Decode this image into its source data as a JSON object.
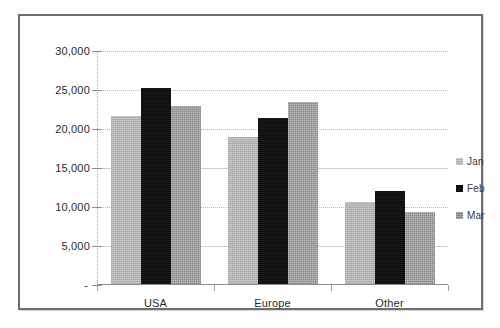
{
  "chart_data": {
    "type": "bar",
    "title": "",
    "xlabel": "",
    "ylabel": "",
    "categories": [
      "USA",
      "Europe",
      "Other"
    ],
    "series": [
      {
        "name": "Jan",
        "color": "#b2b2b2",
        "values": [
          21700,
          19000,
          10700
        ]
      },
      {
        "name": "Feb",
        "color": "#100f0f",
        "values": [
          25300,
          21400,
          12000
        ]
      },
      {
        "name": "Mar",
        "color": "#888888",
        "values": [
          22900,
          23500,
          9400
        ]
      }
    ],
    "ylim": [
      0,
      30000
    ],
    "ytick_values": [
      0,
      5000,
      10000,
      15000,
      20000,
      25000,
      30000
    ],
    "ytick_labels": [
      "-",
      "5,000",
      "10,000",
      "15,000",
      "20,000",
      "25,000",
      "30,000"
    ],
    "grid": true,
    "legend_position": "right"
  },
  "legend": {
    "entries": [
      {
        "label": "Jan"
      },
      {
        "label": "Feb"
      },
      {
        "label": "Mar"
      }
    ]
  }
}
